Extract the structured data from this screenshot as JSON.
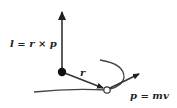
{
  "diagram": {
    "labels": {
      "angular_momentum": "l = r × p",
      "position": "r",
      "momentum": "p = mv"
    },
    "elements": [
      {
        "id": "origin",
        "type": "filled-dot",
        "x": 62,
        "y": 72
      },
      {
        "id": "particle",
        "type": "open-circle",
        "x": 107,
        "y": 90
      },
      {
        "id": "l-vector",
        "type": "arrow",
        "from": [
          62,
          72
        ],
        "to": [
          62,
          8
        ]
      },
      {
        "id": "r-vector",
        "type": "arrow",
        "from": [
          62,
          72
        ],
        "to": [
          104,
          88
        ]
      },
      {
        "id": "p-vector",
        "type": "arrow",
        "from": [
          110,
          88
        ],
        "to": [
          140,
          73
        ]
      },
      {
        "id": "trajectory",
        "type": "curve"
      }
    ],
    "colors": {
      "stroke": "#333333",
      "dot": "#111111",
      "background": "#ffffff"
    }
  }
}
